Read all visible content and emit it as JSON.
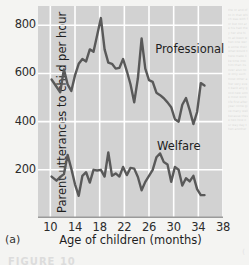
{
  "figure": {
    "panel_label": "(a)",
    "caption_partial": "FIGURE 10",
    "corner_mark": "("
  },
  "chart_data": {
    "type": "line",
    "title": "",
    "xlabel": "Age of children (months)",
    "ylabel": "Parent utterances to child per hour",
    "xlim": [
      8,
      38
    ],
    "ylim": [
      0,
      880
    ],
    "xticks": [
      10,
      14,
      18,
      22,
      26,
      30,
      34,
      38
    ],
    "yticks": [
      200,
      400,
      600,
      800
    ],
    "grid": true,
    "legend_position": "inline-annotation",
    "series": [
      {
        "name": "Professional",
        "label_x": 27.0,
        "label_y": 700,
        "color": "#595959",
        "x": [
          10.2,
          11.0,
          11.6,
          12.2,
          12.8,
          13.4,
          14.0,
          14.6,
          15.2,
          15.8,
          16.4,
          17.0,
          17.6,
          18.2,
          18.8,
          19.4,
          20.0,
          20.6,
          21.2,
          21.8,
          22.4,
          23.0,
          23.6,
          24.2,
          24.8,
          25.4,
          26.0,
          26.6,
          27.2,
          27.8,
          28.4,
          29.0,
          29.6,
          30.2,
          30.8,
          31.4,
          32.0,
          32.6,
          33.2,
          33.8,
          34.4,
          35.0
        ],
        "values": [
          575,
          545,
          522,
          617,
          555,
          527,
          592,
          640,
          660,
          650,
          700,
          690,
          760,
          830,
          700,
          645,
          640,
          620,
          623,
          660,
          610,
          555,
          480,
          580,
          745,
          620,
          572,
          565,
          520,
          510,
          497,
          480,
          460,
          410,
          400,
          470,
          498,
          448,
          390,
          440,
          560,
          550
        ]
      },
      {
        "name": "Welfare",
        "label_x": 27.3,
        "label_y": 300,
        "color": "#595959",
        "x": [
          10.2,
          11.0,
          11.6,
          12.2,
          12.8,
          13.4,
          14.0,
          14.6,
          15.2,
          15.8,
          16.4,
          17.0,
          17.6,
          18.2,
          18.8,
          19.4,
          20.0,
          20.6,
          21.2,
          21.8,
          22.4,
          23.0,
          23.6,
          24.2,
          24.8,
          25.4,
          26.0,
          26.6,
          27.2,
          27.8,
          28.4,
          29.0,
          29.6,
          30.2,
          30.8,
          31.4,
          32.0,
          32.6,
          33.2,
          33.8,
          34.4,
          35.0
        ],
        "values": [
          172,
          155,
          170,
          182,
          262,
          205,
          140,
          92,
          175,
          190,
          147,
          200,
          197,
          200,
          172,
          272,
          175,
          185,
          172,
          212,
          178,
          208,
          205,
          170,
          115,
          150,
          175,
          200,
          252,
          268,
          232,
          222,
          150,
          212,
          200,
          135,
          165,
          152,
          175,
          120,
          95,
          95
        ]
      }
    ]
  },
  "margin": {
    "noise": "the or and of to in that which was with for but not are his had they her she him all been when one were some their what would there make like time into him than its over also now only such most other after very even back any good new some most work life first after year come give many well because these two how our way day then another"
  }
}
